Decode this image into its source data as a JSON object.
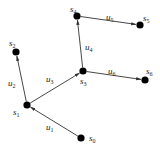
{
  "diagram": {
    "type": "directed-tree",
    "nodes": [
      {
        "id": "s0",
        "name": "s",
        "sub": "0",
        "x": 81,
        "y": 138,
        "lx": 89,
        "ly": 141
      },
      {
        "id": "s1",
        "name": "s",
        "sub": "1",
        "x": 27,
        "y": 105,
        "lx": 13,
        "ly": 115
      },
      {
        "id": "s2",
        "name": "s",
        "sub": "2",
        "x": 16,
        "y": 52,
        "lx": 9,
        "ly": 46
      },
      {
        "id": "s3",
        "name": "s",
        "sub": "3",
        "x": 83,
        "y": 71,
        "lx": 80,
        "ly": 84
      },
      {
        "id": "s4",
        "name": "s",
        "sub": "4",
        "x": 77,
        "y": 16,
        "lx": 70,
        "ly": 12
      },
      {
        "id": "s5",
        "name": "s",
        "sub": "5",
        "x": 140,
        "y": 25,
        "lx": 143,
        "ly": 21
      },
      {
        "id": "s6",
        "name": "s",
        "sub": "6",
        "x": 145,
        "y": 80,
        "lx": 146,
        "ly": 74
      }
    ],
    "edges": [
      {
        "id": "u1",
        "from": "s0",
        "to": "s1",
        "name": "u",
        "sub": "1",
        "lx": 46,
        "ly": 130
      },
      {
        "id": "u2",
        "from": "s1",
        "to": "s2",
        "name": "u",
        "sub": "2",
        "lx": 8,
        "ly": 86
      },
      {
        "id": "u3",
        "from": "s1",
        "to": "s3",
        "name": "u",
        "sub": "3",
        "lx": 46,
        "ly": 82
      },
      {
        "id": "u4",
        "from": "s3",
        "to": "s4",
        "name": "u",
        "sub": "4",
        "lx": 85,
        "ly": 50
      },
      {
        "id": "u5",
        "from": "s4",
        "to": "s5",
        "name": "u",
        "sub": "5",
        "lx": 106,
        "ly": 20
      },
      {
        "id": "u6",
        "from": "s3",
        "to": "s6",
        "name": "u",
        "sub": "6",
        "lx": 108,
        "ly": 74
      }
    ]
  }
}
